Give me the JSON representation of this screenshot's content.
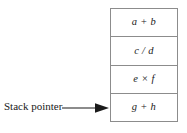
{
  "diagram": {
    "colors": {
      "border": "#8c8c8c",
      "text": "#1a1a1a",
      "background": "#ffffff",
      "arrow": "#1a1a1a"
    },
    "stack": {
      "name": "stack",
      "cells": [
        {
          "label": "a + b",
          "position": "top"
        },
        {
          "label": "c / d",
          "position": "second"
        },
        {
          "label": "e × f",
          "position": "third"
        },
        {
          "label": "g + h",
          "position": "bottom"
        }
      ]
    },
    "pointer": {
      "label": "Stack pointer",
      "arrow_icon": "arrow-right-icon",
      "points_to": "g + h"
    }
  }
}
